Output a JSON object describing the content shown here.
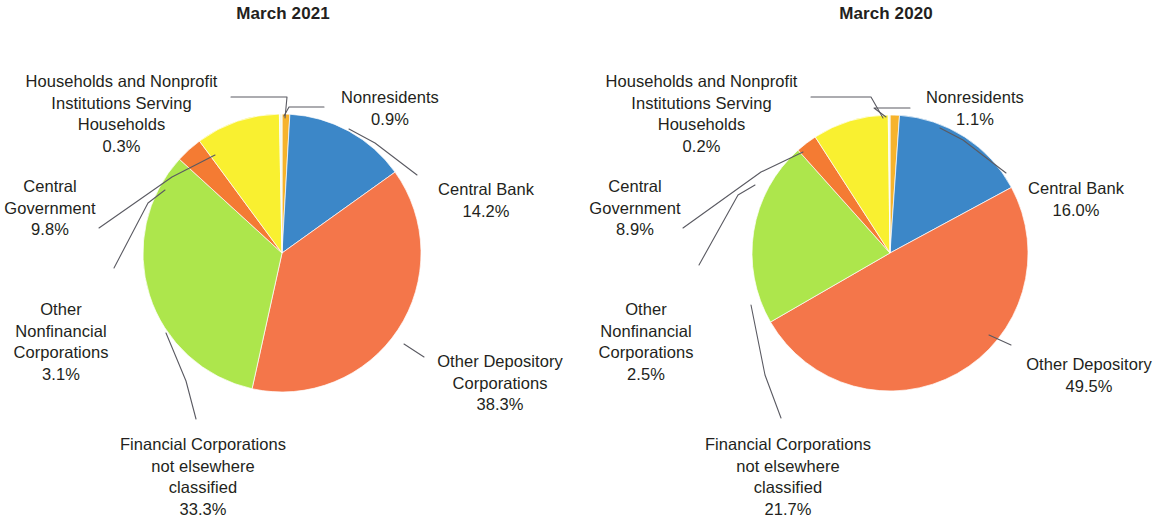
{
  "figure": {
    "background": "#ffffff",
    "panels": [
      "march_2021",
      "march_2020"
    ]
  },
  "palette": {
    "nonresidents": "#F6B32C",
    "central_bank": "#3C87C8",
    "other_depository": "#F4764A",
    "financial_nec": "#ADE64C",
    "other_nonfinancial": "#F47B33",
    "central_government": "#F9F030",
    "households": "#F2F7E8",
    "leader_line": "#5a5a62",
    "text": "#231f20"
  },
  "left": {
    "title": "March 2021",
    "labels": {
      "households": {
        "name": "Households and Nonprofit\nInstitutions Serving\nHouseholds",
        "pct": "0.3%"
      },
      "nonresidents": {
        "name": "Nonresidents",
        "pct": "0.9%"
      },
      "central_bank": {
        "name": "Central Bank",
        "pct": "14.2%"
      },
      "other_depository": {
        "name": "Other Depository\nCorporations",
        "pct": "38.3%"
      },
      "financial_nec": {
        "name": "Financial Corporations\nnot elsewhere\nclassified",
        "pct": "33.3%"
      },
      "other_nonfinancial": {
        "name": "Other\nNonfinancial\nCorporations",
        "pct": "3.1%"
      },
      "central_government": {
        "name": "Central\nGovernment",
        "pct": "9.8%"
      }
    }
  },
  "right": {
    "title": "March 2020",
    "labels": {
      "households": {
        "name": "Households and Nonprofit\nInstitutions Serving\nHouseholds",
        "pct": "0.2%"
      },
      "nonresidents": {
        "name": "Nonresidents",
        "pct": "1.1%"
      },
      "central_bank": {
        "name": "Central Bank",
        "pct": "16.0%"
      },
      "other_depository": {
        "name": "Other Depository",
        "pct": "49.5%"
      },
      "financial_nec": {
        "name": "Financial Corporations\nnot elsewhere\nclassified",
        "pct": "21.7%"
      },
      "other_nonfinancial": {
        "name": "Other\nNonfinancial\nCorporations",
        "pct": "2.5%"
      },
      "central_government": {
        "name": "Central\nGovernment",
        "pct": "8.9%"
      }
    }
  },
  "chart_data": [
    {
      "type": "pie",
      "title": "March 2021",
      "legend": "none",
      "start_angle_deg": 0,
      "direction": "clockwise",
      "categories": [
        "Nonresidents",
        "Central Bank",
        "Other Depository Corporations",
        "Financial Corporations not elsewhere classified",
        "Other Nonfinancial Corporations",
        "Central Government",
        "Households and Nonprofit Institutions Serving Households"
      ],
      "values": [
        0.9,
        14.2,
        38.3,
        33.3,
        3.1,
        9.8,
        0.3
      ],
      "value_labels": [
        "0.9%",
        "14.2%",
        "38.3%",
        "33.3%",
        "3.1%",
        "9.8%",
        "0.3%"
      ],
      "colors": [
        "#F6B32C",
        "#3C87C8",
        "#F4764A",
        "#ADE64C",
        "#F47B33",
        "#F9F030",
        "#F2F7E8"
      ],
      "units": "percent"
    },
    {
      "type": "pie",
      "title": "March 2020",
      "legend": "none",
      "start_angle_deg": 0,
      "direction": "clockwise",
      "categories": [
        "Nonresidents",
        "Central Bank",
        "Other Depository Corporations",
        "Financial Corporations not elsewhere classified",
        "Other Nonfinancial Corporations",
        "Central Government",
        "Households and Nonprofit Institutions Serving Households"
      ],
      "values": [
        1.1,
        16.0,
        49.5,
        21.7,
        2.5,
        8.9,
        0.2
      ],
      "value_labels": [
        "1.1%",
        "16.0%",
        "49.5%",
        "21.7%",
        "2.5%",
        "8.9%",
        "0.2%"
      ],
      "colors": [
        "#F6B32C",
        "#3C87C8",
        "#F4764A",
        "#ADE64C",
        "#F47B33",
        "#F9F030",
        "#F2F7E8"
      ],
      "units": "percent"
    }
  ]
}
